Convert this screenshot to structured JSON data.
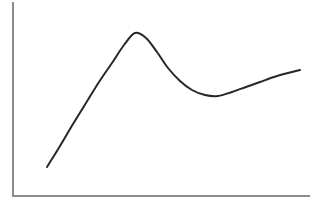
{
  "chart_data": {
    "type": "line",
    "title": "",
    "subtitle": "",
    "xlabel": "",
    "ylabel": "",
    "grid": false,
    "legend": false,
    "legend_position": "none",
    "annotations": [],
    "xtick_labels": [],
    "ytick_labels": [],
    "xlim": [
      0,
      100
    ],
    "ylim": [
      0,
      100
    ],
    "series": [
      {
        "name": "curve",
        "color": "#272727",
        "line_width": 2,
        "x": [
          12,
          18,
          24,
          30,
          36,
          42,
          48,
          54,
          60,
          66,
          72,
          78,
          84,
          90,
          96,
          100
        ],
        "y": [
          16,
          25,
          36,
          48,
          60,
          72,
          82,
          88,
          84,
          74,
          63,
          55,
          52,
          52,
          55,
          59
        ],
        "points_px": [
          [
            47,
            167
          ],
          [
            60,
            146
          ],
          [
            73,
            124
          ],
          [
            86,
            103
          ],
          [
            99,
            82
          ],
          [
            112,
            63
          ],
          [
            124,
            45
          ],
          [
            135,
            33
          ],
          [
            146,
            38
          ],
          [
            157,
            52
          ],
          [
            168,
            68
          ],
          [
            180,
            81
          ],
          [
            192,
            90
          ],
          [
            205,
            95
          ],
          [
            218,
            96
          ],
          [
            232,
            92
          ],
          [
            246,
            87
          ],
          [
            260,
            82
          ],
          [
            274,
            77
          ],
          [
            288,
            73
          ],
          [
            300,
            70
          ]
        ]
      }
    ]
  },
  "axes": {
    "color": "#8c8c8c",
    "width": 2,
    "y_axis": {
      "x": 13,
      "y_top": 2,
      "y_bottom": 197
    },
    "x_axis": {
      "y": 196,
      "x_left": 13,
      "x_right": 310
    }
  },
  "canvas": {
    "background": "#ffffff",
    "width": 322,
    "height": 210
  }
}
